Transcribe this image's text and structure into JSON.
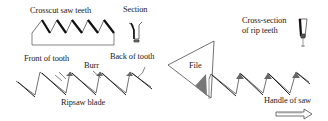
{
  "diagram": {
    "labels": {
      "crosscut": "Crosscut saw teeth",
      "section": "Section",
      "rip_section_line1": "Cross-section",
      "rip_section_line2": "of rip teeth",
      "front_of_tooth": "Front of tooth",
      "burr": "Burr",
      "back_of_tooth": "Back of tooth",
      "file": "File",
      "ripsaw_blade": "Ripsaw blade",
      "handle_of_saw": "Handle of saw"
    },
    "icons": {
      "direction_arrow": "right-arrow-icon"
    },
    "colors": {
      "ink": "#222222",
      "shade": "#555555",
      "background": "#ffffff"
    }
  }
}
